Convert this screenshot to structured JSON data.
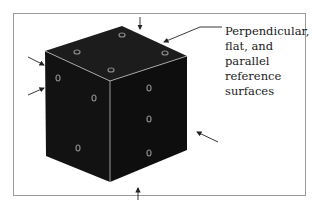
{
  "figure": {
    "callout": {
      "lines": [
        "Perpendicular,",
        "flat, and",
        "parallel",
        "reference",
        "surfaces"
      ]
    },
    "colors": {
      "cube_face": "#151515",
      "cube_edge": "#bdbdbd",
      "hole": "#8a8a8a",
      "arrow": "#222222",
      "frame": "#9a9a9a"
    }
  }
}
